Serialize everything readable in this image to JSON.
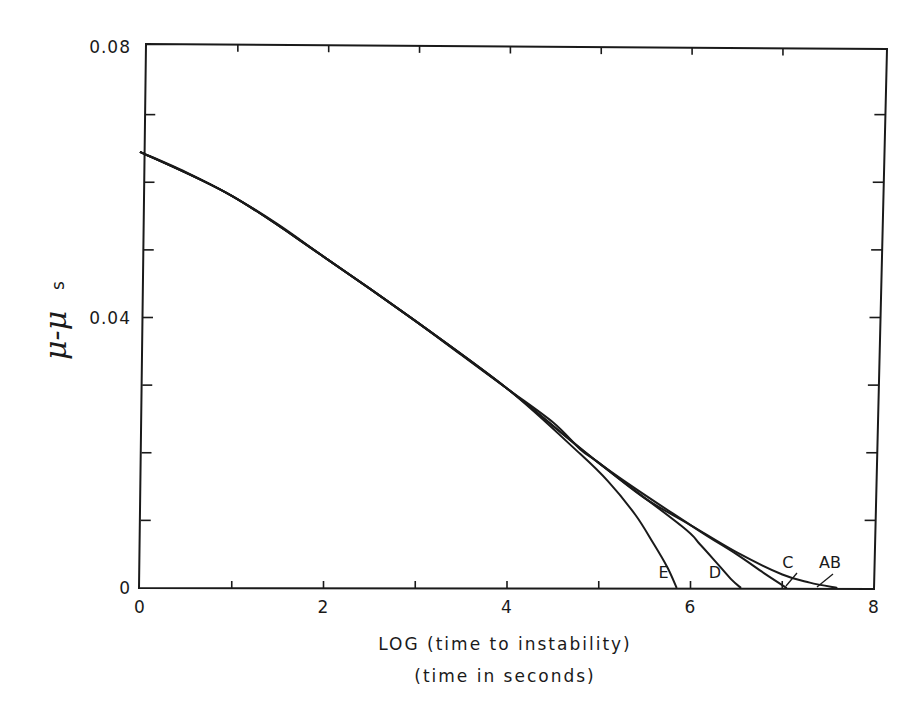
{
  "chart_data": {
    "type": "line",
    "title": "",
    "xlabel": "LOG (time to instability)",
    "xlabel_line2": "(time in seconds)",
    "ylabel": "μ-μs",
    "ylabel_main": "μ-μ",
    "ylabel_sub": "s",
    "xlim": [
      0,
      8
    ],
    "ylim": [
      0,
      0.08
    ],
    "x_ticks": [
      0,
      2,
      4,
      6,
      8
    ],
    "x_tick_labels": [
      "0",
      "2",
      "4",
      "6",
      "8"
    ],
    "x_minor_ticks": [
      1,
      3,
      5,
      7
    ],
    "y_ticks": [
      0,
      0.04,
      0.08
    ],
    "y_tick_labels": [
      "0",
      "0.04",
      "0.08"
    ],
    "y_minor_ticks": [
      0.01,
      0.02,
      0.03,
      0.05,
      0.06,
      0.07
    ],
    "grid": false,
    "legend": "none (curves labeled inline)",
    "series": [
      {
        "name": "AB",
        "x": [
          0,
          0.5,
          1,
          1.5,
          2,
          2.5,
          3,
          3.5,
          4,
          4.5,
          4.8,
          5,
          5.5,
          6,
          6.5,
          7,
          7.3,
          7.6
        ],
        "y": [
          0.0645,
          0.0615,
          0.058,
          0.0538,
          0.049,
          0.0443,
          0.0395,
          0.0345,
          0.0295,
          0.0245,
          0.0205,
          0.0185,
          0.0133,
          0.0093,
          0.0053,
          0.002,
          0.0008,
          0.0
        ]
      },
      {
        "name": "C",
        "x": [
          0,
          1,
          2,
          3,
          4,
          5,
          6,
          6.5,
          6.8,
          7.05
        ],
        "y": [
          0.0645,
          0.058,
          0.049,
          0.0395,
          0.0295,
          0.0185,
          0.0093,
          0.005,
          0.0022,
          0.0
        ]
      },
      {
        "name": "D",
        "x": [
          0,
          1,
          2,
          3,
          4,
          5,
          5.9,
          6.1,
          6.3,
          6.45,
          6.55
        ],
        "y": [
          0.0645,
          0.058,
          0.049,
          0.0395,
          0.0295,
          0.0185,
          0.0092,
          0.0065,
          0.0035,
          0.0012,
          0.0
        ]
      },
      {
        "name": "E",
        "x": [
          0,
          1,
          2,
          3,
          4,
          4.8,
          5.1,
          5.4,
          5.6,
          5.75,
          5.85
        ],
        "y": [
          0.0645,
          0.058,
          0.049,
          0.0395,
          0.0295,
          0.0198,
          0.0158,
          0.0108,
          0.0065,
          0.003,
          0.0
        ]
      }
    ],
    "annotations": [
      {
        "text": "E",
        "x": 5.65,
        "y": 0.0015
      },
      {
        "text": "D",
        "x": 6.2,
        "y": 0.0015
      },
      {
        "text": "C",
        "x": 7.0,
        "y": 0.003
      },
      {
        "text": "AB",
        "x": 7.4,
        "y": 0.003
      }
    ]
  }
}
